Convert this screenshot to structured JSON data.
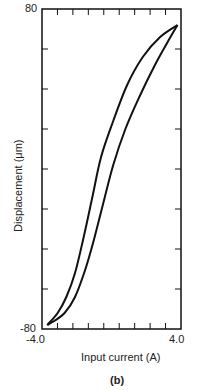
{
  "chart_data": {
    "type": "line",
    "title": "",
    "panel_label": "(b)",
    "xlabel": "Input current (A)",
    "ylabel": "Displacement (μm)",
    "xlim": [
      -4.0,
      4.0
    ],
    "ylim": [
      -80,
      80
    ],
    "x_tick_labels": [
      "-4.0",
      "4.0"
    ],
    "y_tick_labels": [
      "-80",
      "80"
    ],
    "x_minor_ticks": 9,
    "y_minor_ticks": 8,
    "grid": false,
    "legend": null,
    "series": [
      {
        "name": "ascending branch",
        "x": [
          -3.7,
          -3.3,
          -2.7,
          -2.1,
          -1.5,
          -1.0,
          -0.5,
          0.1,
          0.8,
          1.6,
          2.5,
          3.2,
          3.8
        ],
        "y": [
          -78,
          -76,
          -72,
          -64,
          -50,
          -35,
          -18,
          2,
          20,
          36,
          52,
          63,
          72
        ]
      },
      {
        "name": "descending branch",
        "x": [
          3.8,
          2.8,
          1.8,
          0.9,
          0.1,
          -0.6,
          -1.1,
          -1.6,
          -2.1,
          -2.6,
          -3.1,
          -3.7
        ],
        "y": [
          72,
          66,
          56,
          42,
          24,
          6,
          -14,
          -34,
          -52,
          -64,
          -72,
          -78
        ]
      }
    ]
  }
}
